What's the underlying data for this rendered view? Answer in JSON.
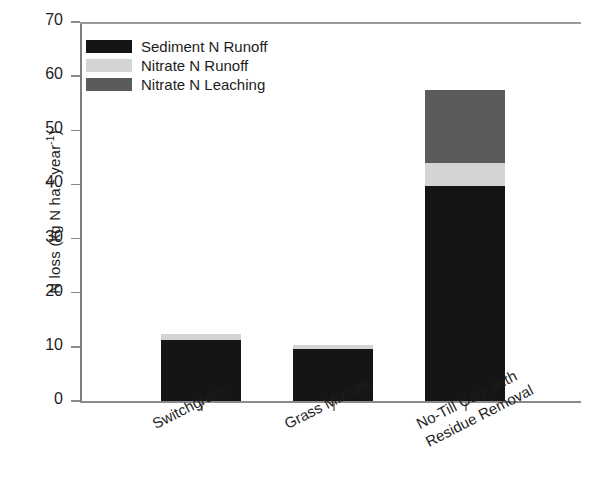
{
  "chart_data": {
    "type": "bar",
    "subtype": "stacked",
    "title": "",
    "xlabel": "",
    "ylabel": "N loss (kg N ha⁻¹ year⁻¹)",
    "ylabel_parts": {
      "prefix": "N loss (kg N ha",
      "sup1": "-1",
      "middle": " year",
      "sup2": "-1",
      "suffix": ")"
    },
    "categories": [
      "Switchgrass",
      "Grass Mixture",
      "No-Till Corn with Residue Removal"
    ],
    "category_lines": [
      [
        "Switchgrass"
      ],
      [
        "Grass Mixture"
      ],
      [
        "No-Till Corn with",
        "Residue Removal"
      ]
    ],
    "series": [
      {
        "name": "Sediment N Runoff",
        "color": "#151515",
        "values": [
          11.2,
          9.6,
          39.8
        ]
      },
      {
        "name": "Nitrate N Runoff",
        "color": "#d4d4d4",
        "values": [
          1.1,
          0.7,
          4.1
        ]
      },
      {
        "name": "Nitrate N Leaching",
        "color": "#5b5b5b",
        "values": [
          0.0,
          0.0,
          13.6
        ]
      }
    ],
    "totals": [
      12.3,
      10.3,
      57.5
    ],
    "ylim": [
      0,
      70
    ],
    "yticks": [
      0,
      10,
      20,
      30,
      40,
      50,
      60,
      70
    ],
    "ytick_labels": [
      "0",
      "10",
      "20",
      "30",
      "40",
      "50",
      "60",
      "70"
    ],
    "grid": false,
    "legend_position": "upper left",
    "legend_entries": [
      "Sediment N Runoff",
      "Nitrate N Runoff",
      "Nitrate N Leaching"
    ],
    "xlabel_rotation_deg": -27,
    "axis_color": "#8a8a8a"
  }
}
